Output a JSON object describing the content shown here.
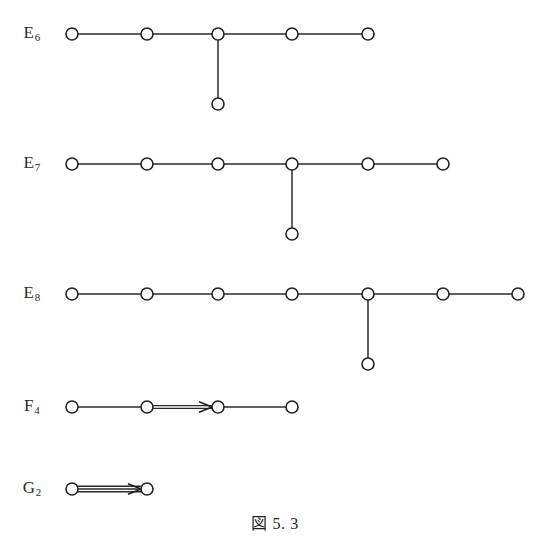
{
  "figure": {
    "caption": "図 5. 3",
    "background_color": "#ffffff",
    "ink_color": "#222222",
    "node_radius": 6,
    "node_fill": "#ffffff"
  },
  "diagrams": [
    {
      "id": "E6",
      "label_letter": "E",
      "label_sub": "6",
      "label_x": 32,
      "label_y": 34,
      "chain_y": 34,
      "nodes": [
        {
          "name": "e6-node-1",
          "x": 72,
          "y": 34
        },
        {
          "name": "e6-node-2",
          "x": 147,
          "y": 34
        },
        {
          "name": "e6-node-3",
          "x": 218,
          "y": 34
        },
        {
          "name": "e6-node-4",
          "x": 292,
          "y": 34
        },
        {
          "name": "e6-node-5",
          "x": 368,
          "y": 34
        },
        {
          "name": "e6-node-branch",
          "x": 218,
          "y": 104
        }
      ],
      "edges": [
        {
          "name": "e6-edge-1-2",
          "x1": 72,
          "y1": 34,
          "x2": 147,
          "y2": 34,
          "multiplicity": 1,
          "arrow": "none"
        },
        {
          "name": "e6-edge-2-3",
          "x1": 147,
          "y1": 34,
          "x2": 218,
          "y2": 34,
          "multiplicity": 1,
          "arrow": "none"
        },
        {
          "name": "e6-edge-3-4",
          "x1": 218,
          "y1": 34,
          "x2": 292,
          "y2": 34,
          "multiplicity": 1,
          "arrow": "none"
        },
        {
          "name": "e6-edge-4-5",
          "x1": 292,
          "y1": 34,
          "x2": 368,
          "y2": 34,
          "multiplicity": 1,
          "arrow": "none"
        },
        {
          "name": "e6-edge-3-branch",
          "x1": 218,
          "y1": 34,
          "x2": 218,
          "y2": 104,
          "multiplicity": 1,
          "arrow": "none"
        }
      ]
    },
    {
      "id": "E7",
      "label_letter": "E",
      "label_sub": "7",
      "label_x": 32,
      "label_y": 164,
      "chain_y": 164,
      "nodes": [
        {
          "name": "e7-node-1",
          "x": 72,
          "y": 164
        },
        {
          "name": "e7-node-2",
          "x": 147,
          "y": 164
        },
        {
          "name": "e7-node-3",
          "x": 218,
          "y": 164
        },
        {
          "name": "e7-node-4",
          "x": 292,
          "y": 164
        },
        {
          "name": "e7-node-5",
          "x": 368,
          "y": 164
        },
        {
          "name": "e7-node-6",
          "x": 443,
          "y": 164
        },
        {
          "name": "e7-node-branch",
          "x": 292,
          "y": 234
        }
      ],
      "edges": [
        {
          "name": "e7-edge-1-2",
          "x1": 72,
          "y1": 164,
          "x2": 147,
          "y2": 164,
          "multiplicity": 1,
          "arrow": "none"
        },
        {
          "name": "e7-edge-2-3",
          "x1": 147,
          "y1": 164,
          "x2": 218,
          "y2": 164,
          "multiplicity": 1,
          "arrow": "none"
        },
        {
          "name": "e7-edge-3-4",
          "x1": 218,
          "y1": 164,
          "x2": 292,
          "y2": 164,
          "multiplicity": 1,
          "arrow": "none"
        },
        {
          "name": "e7-edge-4-5",
          "x1": 292,
          "y1": 164,
          "x2": 368,
          "y2": 164,
          "multiplicity": 1,
          "arrow": "none"
        },
        {
          "name": "e7-edge-5-6",
          "x1": 368,
          "y1": 164,
          "x2": 443,
          "y2": 164,
          "multiplicity": 1,
          "arrow": "none"
        },
        {
          "name": "e7-edge-4-branch",
          "x1": 292,
          "y1": 164,
          "x2": 292,
          "y2": 234,
          "multiplicity": 1,
          "arrow": "none"
        }
      ]
    },
    {
      "id": "E8",
      "label_letter": "E",
      "label_sub": "8",
      "label_x": 32,
      "label_y": 294,
      "chain_y": 294,
      "nodes": [
        {
          "name": "e8-node-1",
          "x": 72,
          "y": 294
        },
        {
          "name": "e8-node-2",
          "x": 147,
          "y": 294
        },
        {
          "name": "e8-node-3",
          "x": 218,
          "y": 294
        },
        {
          "name": "e8-node-4",
          "x": 292,
          "y": 294
        },
        {
          "name": "e8-node-5",
          "x": 368,
          "y": 294
        },
        {
          "name": "e8-node-6",
          "x": 443,
          "y": 294
        },
        {
          "name": "e8-node-7",
          "x": 518,
          "y": 294
        },
        {
          "name": "e8-node-branch",
          "x": 368,
          "y": 364
        }
      ],
      "edges": [
        {
          "name": "e8-edge-1-2",
          "x1": 72,
          "y1": 294,
          "x2": 147,
          "y2": 294,
          "multiplicity": 1,
          "arrow": "none"
        },
        {
          "name": "e8-edge-2-3",
          "x1": 147,
          "y1": 294,
          "x2": 218,
          "y2": 294,
          "multiplicity": 1,
          "arrow": "none"
        },
        {
          "name": "e8-edge-3-4",
          "x1": 218,
          "y1": 294,
          "x2": 292,
          "y2": 294,
          "multiplicity": 1,
          "arrow": "none"
        },
        {
          "name": "e8-edge-4-5",
          "x1": 292,
          "y1": 294,
          "x2": 368,
          "y2": 294,
          "multiplicity": 1,
          "arrow": "none"
        },
        {
          "name": "e8-edge-5-6",
          "x1": 368,
          "y1": 294,
          "x2": 443,
          "y2": 294,
          "multiplicity": 1,
          "arrow": "none"
        },
        {
          "name": "e8-edge-6-7",
          "x1": 443,
          "y1": 294,
          "x2": 518,
          "y2": 294,
          "multiplicity": 1,
          "arrow": "none"
        },
        {
          "name": "e8-edge-5-branch",
          "x1": 368,
          "y1": 294,
          "x2": 368,
          "y2": 364,
          "multiplicity": 1,
          "arrow": "none"
        }
      ]
    },
    {
      "id": "F4",
      "label_letter": "F",
      "label_sub": "4",
      "label_x": 32,
      "label_y": 407,
      "chain_y": 407,
      "nodes": [
        {
          "name": "f4-node-1",
          "x": 72,
          "y": 407
        },
        {
          "name": "f4-node-2",
          "x": 147,
          "y": 407
        },
        {
          "name": "f4-node-3",
          "x": 218,
          "y": 407
        },
        {
          "name": "f4-node-4",
          "x": 292,
          "y": 407
        }
      ],
      "edges": [
        {
          "name": "f4-edge-1-2",
          "x1": 72,
          "y1": 407,
          "x2": 147,
          "y2": 407,
          "multiplicity": 1,
          "arrow": "none"
        },
        {
          "name": "f4-edge-2-3-double",
          "x1": 147,
          "y1": 407,
          "x2": 218,
          "y2": 407,
          "multiplicity": 2,
          "arrow": "right"
        },
        {
          "name": "f4-edge-3-4",
          "x1": 218,
          "y1": 407,
          "x2": 292,
          "y2": 407,
          "multiplicity": 1,
          "arrow": "none"
        }
      ]
    },
    {
      "id": "G2",
      "label_letter": "G",
      "label_sub": "2",
      "label_x": 32,
      "label_y": 489,
      "chain_y": 489,
      "nodes": [
        {
          "name": "g2-node-1",
          "x": 72,
          "y": 489
        },
        {
          "name": "g2-node-2",
          "x": 147,
          "y": 489
        }
      ],
      "edges": [
        {
          "name": "g2-edge-1-2-triple",
          "x1": 72,
          "y1": 489,
          "x2": 147,
          "y2": 489,
          "multiplicity": 3,
          "arrow": "right"
        }
      ]
    }
  ]
}
